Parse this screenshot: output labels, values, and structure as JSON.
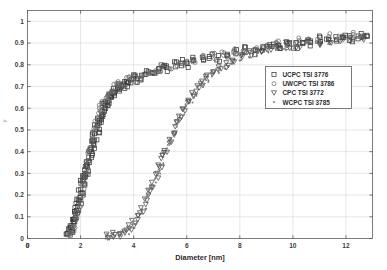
{
  "figure": {
    "background_color": "#ffffff",
    "plot_area_color": "#ffffff",
    "grid_color": "#d8d8d8",
    "axis_color": "#5a5a5a",
    "marker_color": "#3a3a3a",
    "ylabel_partial": "y"
  },
  "chart_data": {
    "type": "scatter",
    "title": "",
    "xlabel": "Diameter [nm]",
    "ylabel": "",
    "xlim": [
      0,
      13
    ],
    "ylim": [
      0,
      1.05
    ],
    "xticks": [
      0,
      2,
      4,
      6,
      8,
      10,
      12
    ],
    "xticklabels": [
      "0",
      "2",
      "4",
      "6",
      "8",
      "10",
      "12"
    ],
    "yticks": [
      0,
      0.1,
      0.2,
      0.3,
      0.4,
      0.5,
      0.6,
      0.7,
      0.8,
      0.9,
      1
    ],
    "yticklabels": [
      "0",
      "0.1",
      "0.2",
      "0.3",
      "0.4",
      "0.5",
      "0.6",
      "0.7",
      "0.8",
      "0.9",
      "1"
    ],
    "grid": true,
    "grid_axes": "both",
    "legend_position": "center-right",
    "legend_border": true,
    "series": [
      {
        "name": "UCPC TSI 3776",
        "marker": "square-open",
        "color": "#3a3a3a",
        "points": [
          [
            1.52,
            0.02
          ],
          [
            1.58,
            0.03
          ],
          [
            1.62,
            0.05
          ],
          [
            1.66,
            0.04
          ],
          [
            1.7,
            0.08
          ],
          [
            1.74,
            0.07
          ],
          [
            1.78,
            0.12
          ],
          [
            1.8,
            0.1
          ],
          [
            1.84,
            0.15
          ],
          [
            1.88,
            0.13
          ],
          [
            1.92,
            0.18
          ],
          [
            1.95,
            0.17
          ],
          [
            1.98,
            0.22
          ],
          [
            2.02,
            0.2
          ],
          [
            2.05,
            0.26
          ],
          [
            2.08,
            0.24
          ],
          [
            2.1,
            0.3
          ],
          [
            2.14,
            0.28
          ],
          [
            2.18,
            0.33
          ],
          [
            2.22,
            0.31
          ],
          [
            2.26,
            0.36
          ],
          [
            2.3,
            0.34
          ],
          [
            2.34,
            0.4
          ],
          [
            2.38,
            0.38
          ],
          [
            2.42,
            0.44
          ],
          [
            2.46,
            0.42
          ],
          [
            2.5,
            0.48
          ],
          [
            2.55,
            0.46
          ],
          [
            2.6,
            0.52
          ],
          [
            2.64,
            0.5
          ],
          [
            2.68,
            0.55
          ],
          [
            2.72,
            0.53
          ],
          [
            2.78,
            0.58
          ],
          [
            2.82,
            0.56
          ],
          [
            2.88,
            0.61
          ],
          [
            2.94,
            0.59
          ],
          [
            3.0,
            0.63
          ],
          [
            3.06,
            0.62
          ],
          [
            3.12,
            0.66
          ],
          [
            3.18,
            0.65
          ],
          [
            3.24,
            0.68
          ],
          [
            3.3,
            0.67
          ],
          [
            3.38,
            0.7
          ],
          [
            3.44,
            0.69
          ],
          [
            3.52,
            0.71
          ],
          [
            3.6,
            0.7
          ],
          [
            3.7,
            0.72
          ],
          [
            3.8,
            0.71
          ],
          [
            3.92,
            0.73
          ],
          [
            4.05,
            0.74
          ],
          [
            4.2,
            0.73
          ],
          [
            4.35,
            0.75
          ],
          [
            4.5,
            0.76
          ],
          [
            4.7,
            0.77
          ],
          [
            4.9,
            0.78
          ],
          [
            5.1,
            0.79
          ],
          [
            5.3,
            0.78
          ],
          [
            5.55,
            0.8
          ],
          [
            5.8,
            0.81
          ],
          [
            6.05,
            0.8
          ],
          [
            6.3,
            0.82
          ],
          [
            6.6,
            0.83
          ],
          [
            6.9,
            0.84
          ],
          [
            7.2,
            0.83
          ],
          [
            7.5,
            0.85
          ],
          [
            7.85,
            0.86
          ],
          [
            8.2,
            0.87
          ],
          [
            8.55,
            0.86
          ],
          [
            8.9,
            0.88
          ],
          [
            9.2,
            0.89
          ],
          [
            9.5,
            0.88
          ],
          [
            9.8,
            0.9
          ],
          [
            10.1,
            0.89
          ],
          [
            10.4,
            0.91
          ],
          [
            10.7,
            0.9
          ],
          [
            11.0,
            0.92
          ],
          [
            11.3,
            0.91
          ],
          [
            11.6,
            0.92
          ],
          [
            11.9,
            0.93
          ],
          [
            12.2,
            0.92
          ],
          [
            12.5,
            0.93
          ],
          [
            12.75,
            0.94
          ]
        ]
      },
      {
        "name": "UWCPC TSI 3786",
        "marker": "circle-open",
        "color": "#6b6b6b",
        "points": [
          [
            1.6,
            0.02
          ],
          [
            1.68,
            0.04
          ],
          [
            1.74,
            0.06
          ],
          [
            1.8,
            0.09
          ],
          [
            1.86,
            0.11
          ],
          [
            1.92,
            0.14
          ],
          [
            1.98,
            0.17
          ],
          [
            2.04,
            0.21
          ],
          [
            2.1,
            0.24
          ],
          [
            2.16,
            0.28
          ],
          [
            2.22,
            0.32
          ],
          [
            2.28,
            0.35
          ],
          [
            2.34,
            0.39
          ],
          [
            2.4,
            0.43
          ],
          [
            2.46,
            0.46
          ],
          [
            2.54,
            0.5
          ],
          [
            2.62,
            0.53
          ],
          [
            2.7,
            0.57
          ],
          [
            2.78,
            0.6
          ],
          [
            2.88,
            0.62
          ],
          [
            2.98,
            0.65
          ],
          [
            3.08,
            0.67
          ],
          [
            3.2,
            0.69
          ],
          [
            3.32,
            0.7
          ],
          [
            3.46,
            0.72
          ],
          [
            3.6,
            0.71
          ],
          [
            3.76,
            0.73
          ],
          [
            3.94,
            0.74
          ],
          [
            4.12,
            0.73
          ],
          [
            4.32,
            0.75
          ],
          [
            4.55,
            0.76
          ],
          [
            4.8,
            0.77
          ],
          [
            5.05,
            0.78
          ],
          [
            5.35,
            0.79
          ],
          [
            5.65,
            0.8
          ],
          [
            5.95,
            0.81
          ],
          [
            6.3,
            0.82
          ],
          [
            6.65,
            0.83
          ],
          [
            7.0,
            0.84
          ],
          [
            7.4,
            0.85
          ],
          [
            7.8,
            0.86
          ],
          [
            8.2,
            0.87
          ],
          [
            8.6,
            0.88
          ],
          [
            9.0,
            0.89
          ],
          [
            9.4,
            0.9
          ],
          [
            9.8,
            0.89
          ],
          [
            10.2,
            0.91
          ],
          [
            10.6,
            0.92
          ],
          [
            11.0,
            0.91
          ],
          [
            11.4,
            0.93
          ],
          [
            11.8,
            0.92
          ],
          [
            12.2,
            0.94
          ],
          [
            12.6,
            0.93
          ]
        ]
      },
      {
        "name": "CPC TSI 3772",
        "marker": "triangle-down-open",
        "color": "#4a4a4a",
        "points": [
          [
            3.05,
            0.01
          ],
          [
            3.25,
            0.02
          ],
          [
            3.45,
            0.02
          ],
          [
            3.65,
            0.03
          ],
          [
            3.85,
            0.05
          ],
          [
            4.0,
            0.07
          ],
          [
            4.15,
            0.1
          ],
          [
            4.3,
            0.13
          ],
          [
            4.45,
            0.17
          ],
          [
            4.6,
            0.21
          ],
          [
            4.72,
            0.25
          ],
          [
            4.85,
            0.29
          ],
          [
            4.98,
            0.33
          ],
          [
            5.1,
            0.37
          ],
          [
            5.22,
            0.41
          ],
          [
            5.35,
            0.45
          ],
          [
            5.48,
            0.49
          ],
          [
            5.6,
            0.53
          ],
          [
            5.75,
            0.56
          ],
          [
            5.9,
            0.6
          ],
          [
            6.05,
            0.63
          ],
          [
            6.22,
            0.66
          ],
          [
            6.4,
            0.69
          ],
          [
            6.6,
            0.71
          ],
          [
            6.8,
            0.74
          ],
          [
            7.0,
            0.76
          ],
          [
            7.25,
            0.78
          ],
          [
            7.5,
            0.8
          ],
          [
            7.8,
            0.82
          ],
          [
            8.1,
            0.84
          ],
          [
            8.4,
            0.85
          ],
          [
            8.75,
            0.86
          ],
          [
            9.1,
            0.87
          ],
          [
            9.45,
            0.88
          ],
          [
            9.8,
            0.89
          ],
          [
            10.2,
            0.89
          ],
          [
            10.6,
            0.9
          ],
          [
            11.0,
            0.9
          ],
          [
            11.4,
            0.91
          ],
          [
            11.8,
            0.91
          ],
          [
            12.2,
            0.92
          ],
          [
            12.6,
            0.92
          ]
        ]
      },
      {
        "name": "WCPC TSI 3785",
        "marker": "dot",
        "color": "#7d7d7d",
        "points": [
          [
            2.95,
            0.01
          ],
          [
            3.2,
            0.01
          ],
          [
            3.5,
            0.02
          ],
          [
            3.75,
            0.03
          ],
          [
            3.95,
            0.05
          ],
          [
            4.1,
            0.08
          ],
          [
            4.25,
            0.11
          ],
          [
            4.4,
            0.15
          ],
          [
            4.55,
            0.19
          ],
          [
            4.68,
            0.23
          ],
          [
            4.8,
            0.27
          ],
          [
            4.93,
            0.31
          ],
          [
            5.05,
            0.35
          ],
          [
            5.18,
            0.39
          ],
          [
            5.3,
            0.43
          ],
          [
            5.43,
            0.47
          ],
          [
            5.56,
            0.51
          ],
          [
            5.7,
            0.54
          ],
          [
            5.85,
            0.58
          ],
          [
            6.0,
            0.61
          ],
          [
            6.18,
            0.64
          ],
          [
            6.36,
            0.67
          ],
          [
            6.55,
            0.7
          ],
          [
            6.75,
            0.72
          ],
          [
            6.95,
            0.75
          ],
          [
            7.18,
            0.77
          ],
          [
            7.42,
            0.79
          ],
          [
            7.7,
            0.81
          ],
          [
            8.0,
            0.83
          ],
          [
            8.3,
            0.84
          ],
          [
            8.65,
            0.85
          ],
          [
            9.0,
            0.87
          ],
          [
            9.35,
            0.88
          ],
          [
            9.7,
            0.88
          ],
          [
            10.1,
            0.89
          ],
          [
            10.5,
            0.9
          ],
          [
            10.9,
            0.9
          ],
          [
            11.3,
            0.91
          ],
          [
            11.7,
            0.92
          ],
          [
            12.1,
            0.92
          ],
          [
            12.5,
            0.93
          ]
        ]
      }
    ]
  }
}
